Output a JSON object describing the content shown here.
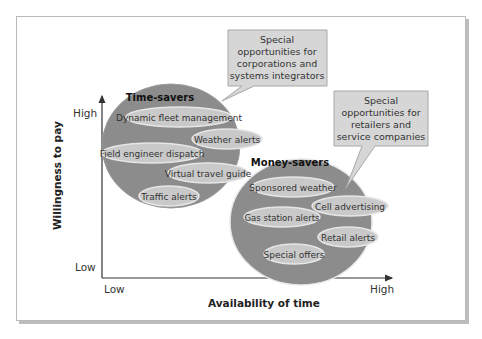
{
  "diagram": {
    "y_axis": {
      "label": "Willingness to pay",
      "high": "High",
      "low": "Low"
    },
    "x_axis": {
      "label": "Availability of time",
      "low": "Low",
      "high": "High"
    },
    "groups": [
      {
        "title": "Time-savers",
        "items": [
          "Dynamic fleet management",
          "Weather alerts",
          "Field engineer dispatch",
          "Virtual travel guide",
          "Traffic alerts"
        ]
      },
      {
        "title": "Money-savers",
        "items": [
          "Sponsored weather",
          "Cell advertising",
          "Gas station alerts",
          "Retail alerts",
          "Special offers"
        ]
      }
    ],
    "callouts": [
      {
        "lines": [
          "Special",
          "opportunities for",
          "corporations and",
          "systems integrators"
        ]
      },
      {
        "lines": [
          "Special",
          "opportunities for",
          "retailers and",
          "service companies"
        ]
      }
    ],
    "colors": {
      "group_fill": "#8c8c8c",
      "item_fill": "#c9c9c9",
      "callout_fill": "#d6d6d6",
      "axis": "#333333"
    }
  }
}
